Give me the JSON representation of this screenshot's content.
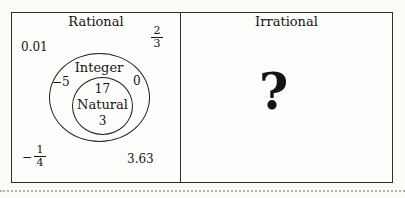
{
  "rational": {
    "title": "Rational",
    "examples": {
      "decimal_small": "0.01",
      "two_thirds": {
        "numerator": "2",
        "denominator": "3"
      },
      "neg_one_fourth": {
        "sign": "−",
        "numerator": "1",
        "denominator": "4"
      },
      "decimal_large": "3.63"
    },
    "integer_set": {
      "label": "Integer",
      "neg_five": "−5",
      "zero": "0",
      "seventeen": "17",
      "natural_set": {
        "label": "Natural",
        "three": "3"
      }
    }
  },
  "irrational": {
    "title": "Irrational",
    "placeholder": "?"
  },
  "colors": {
    "ink": "#141414",
    "border": "#2e2e2c",
    "paper": "#fbfbf8"
  }
}
